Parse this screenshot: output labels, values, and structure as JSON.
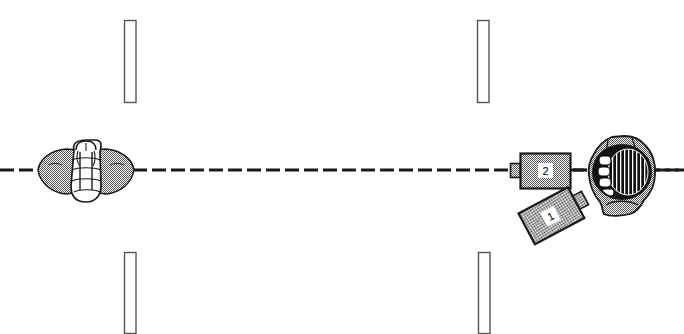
{
  "figure": {
    "width": 684,
    "height": 334,
    "background_color": "#ffffff",
    "line_color": "#1a1a1a",
    "stipple_fill_color": "#9a9a9a",
    "dark_fill_color": "#111111"
  },
  "centerline": {
    "name": "horizontal-axis",
    "style": "dashed",
    "y": 170,
    "x_start": 0,
    "x_end": 684,
    "dash_length": 14,
    "gap_length": 5,
    "stroke_width": 3,
    "color": "#1a1a1a"
  },
  "callouts": [
    {
      "id": "1",
      "label": "1",
      "name": "callout-label-1",
      "x": 548,
      "y": 230,
      "attached_to": "tilted-device-body"
    },
    {
      "id": "2",
      "label": "2",
      "name": "callout-label-2",
      "x": 545,
      "y": 171,
      "attached_to": "inline-device-body"
    }
  ],
  "posts": [
    {
      "name": "post-top-left",
      "x": 124,
      "y": 20,
      "width": 12,
      "height": 83
    },
    {
      "name": "post-top-right",
      "x": 477,
      "y": 20,
      "width": 12,
      "height": 83
    },
    {
      "name": "post-bottom-left",
      "x": 124,
      "y": 252,
      "width": 12,
      "height": 82
    },
    {
      "name": "post-bottom-right",
      "x": 478,
      "y": 252,
      "width": 12,
      "height": 82
    }
  ],
  "objects": [
    {
      "name": "left-hand-fist",
      "description": "clenched hand viewed end-on at left of centerline",
      "bounds": {
        "x": 36,
        "y": 140,
        "width": 100,
        "height": 62
      }
    },
    {
      "name": "inline-device-body",
      "description": "rectangular stippled device body aligned on the centerline, labeled 2",
      "bounds": {
        "x": 520,
        "y": 153,
        "width": 50,
        "height": 35
      },
      "nozzle": {
        "x": 510,
        "y": 163,
        "width": 11,
        "height": 15
      }
    },
    {
      "name": "tilted-device-body",
      "description": "rectangular stippled device body rotated counter-clockwise, labeled 1",
      "bounds": {
        "x": 523,
        "y": 198,
        "width": 56,
        "height": 36
      },
      "rotation_degrees": -28
    },
    {
      "name": "right-hand-gripping-cylinder",
      "description": "hand gripping a dark cross-hatched cylindrical object on the centerline",
      "bounds": {
        "x": 588,
        "y": 136,
        "width": 68,
        "height": 80
      }
    }
  ]
}
